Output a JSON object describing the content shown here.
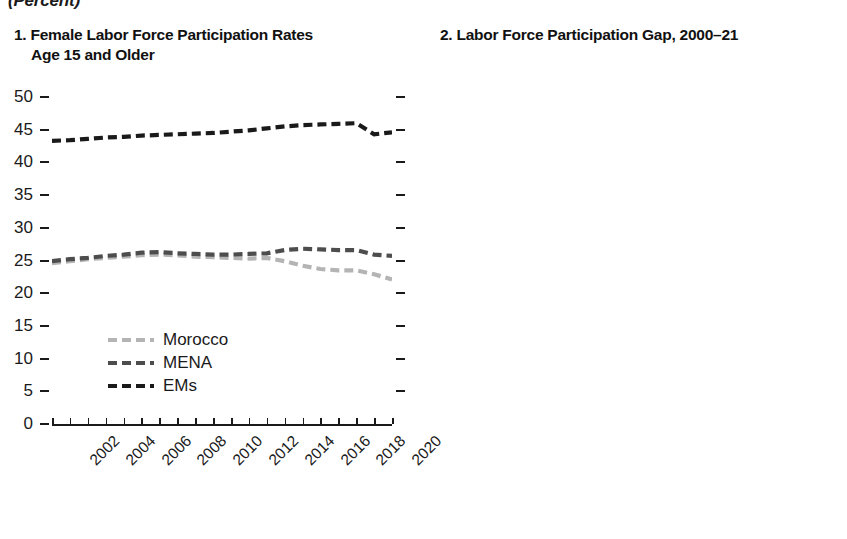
{
  "unit_header": "(Percent)",
  "panel1": {
    "title_line1": "1. Female Labor Force Participation Rates",
    "title_line2": "Age 15 and Older",
    "legend": [
      {
        "label": "Morocco",
        "color": "#b4b4b4"
      },
      {
        "label": "MENA",
        "color": "#4d4d4d"
      },
      {
        "label": "EMs",
        "color": "#1a1a1a"
      }
    ]
  },
  "panel2": {
    "title": "2. Labor Force Participation Gap, 2000–21",
    "legend": [
      {
        "label": "2000",
        "color": "#9a9a9a"
      },
      {
        "label": "2010",
        "color": "#3d3d3d"
      },
      {
        "label": "2021",
        "color": "#606060"
      }
    ]
  },
  "chart_data": [
    {
      "type": "line",
      "title": "1. Female Labor Force Participation Rates Age 15 and Older",
      "xlabel": "",
      "ylabel": "",
      "unit": "Percent",
      "ylim": [
        0,
        50
      ],
      "yticks": [
        0,
        5,
        10,
        15,
        20,
        25,
        30,
        35,
        40,
        45,
        50
      ],
      "grid": false,
      "legend_position": "inside-lower-left",
      "x": [
        2002,
        2003,
        2004,
        2005,
        2006,
        2007,
        2008,
        2009,
        2010,
        2011,
        2012,
        2013,
        2014,
        2015,
        2016,
        2017,
        2018,
        2019,
        2020,
        2021
      ],
      "xtick_labels": [
        "2002",
        "2004",
        "2006",
        "2008",
        "2010",
        "2012",
        "2014",
        "2016",
        "2018",
        "2020"
      ],
      "series": [
        {
          "name": "Morocco",
          "color": "#b4b4b4",
          "values": [
            24.6,
            24.9,
            25.2,
            25.4,
            25.6,
            25.8,
            25.9,
            25.8,
            25.6,
            25.5,
            25.4,
            25.3,
            25.4,
            24.9,
            24.2,
            23.7,
            23.5,
            23.5,
            22.9,
            22.1
          ]
        },
        {
          "name": "MENA",
          "color": "#4d4d4d",
          "values": [
            24.9,
            25.2,
            25.4,
            25.7,
            25.9,
            26.2,
            26.3,
            26.1,
            26.0,
            25.9,
            25.9,
            26.0,
            26.1,
            26.6,
            26.8,
            26.7,
            26.6,
            26.6,
            25.9,
            25.7
          ]
        },
        {
          "name": "EMs",
          "color": "#1a1a1a",
          "values": [
            43.3,
            43.4,
            43.6,
            43.8,
            43.9,
            44.1,
            44.2,
            44.3,
            44.4,
            44.5,
            44.7,
            44.9,
            45.2,
            45.5,
            45.7,
            45.8,
            45.9,
            46.0,
            44.3,
            44.6
          ]
        }
      ]
    },
    {
      "type": "bar",
      "title": "2. Labor Force Participation Gap, 2000–21",
      "xlabel": "",
      "ylabel": "",
      "unit": "Percent",
      "ylim": [
        0,
        70
      ],
      "yticks": [
        0,
        10,
        20,
        30,
        40,
        50,
        60,
        70
      ],
      "grid": false,
      "legend_position": "top-center",
      "axis_side": "right",
      "categories": [
        "Morocco",
        "MENAP OI",
        "Asia",
        "LAC",
        "EM Europe",
        "Egypt",
        "Jordan",
        "Mauritania",
        "Morocco",
        "Pakistan"
      ],
      "series": [
        {
          "name": "2000",
          "color": "#9a9a9a",
          "values": [
            53.0,
            49.0,
            22.5,
            30.0,
            17.5,
            52.0,
            48.0,
            42.0,
            53.5,
            66.0
          ]
        },
        {
          "name": "2010",
          "color": "#3d3d3d",
          "values": [
            49.0,
            46.0,
            21.0,
            25.0,
            17.0,
            52.3,
            45.5,
            36.0,
            49.0,
            57.0
          ]
        },
        {
          "name": "2021",
          "color": "#606060",
          "values": [
            44.0,
            43.5,
            20.0,
            22.5,
            17.0,
            52.0,
            49.0,
            35.0,
            44.0,
            58.0
          ]
        }
      ]
    }
  ]
}
